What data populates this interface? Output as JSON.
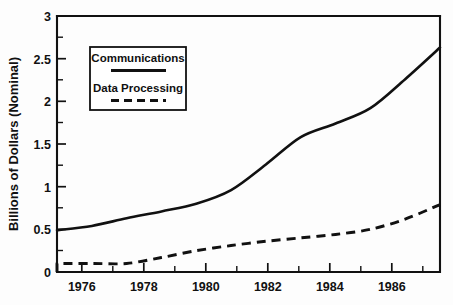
{
  "chart_data": {
    "type": "line",
    "title": "",
    "xlabel": "",
    "ylabel": "Billions of Dollars (Nominal)",
    "xlim": [
      1976,
      1987
    ],
    "ylim": [
      0,
      3
    ],
    "grid": false,
    "legend_position": "upper-left-inside",
    "x_tick_labels": [
      "1976",
      "1978",
      "1980",
      "1982",
      "1984",
      "1986"
    ],
    "x_tick_values": [
      1976,
      1978,
      1980,
      1982,
      1984,
      1986
    ],
    "x_minor_ticks": [
      1977,
      1979,
      1981,
      1983,
      1985,
      1987
    ],
    "y_tick_labels": [
      "0",
      "0.5",
      "1",
      "1.5",
      "2",
      "2.5",
      "3"
    ],
    "y_tick_values": [
      0,
      0.5,
      1,
      1.5,
      2,
      2.5,
      3
    ],
    "y_minor_ticks": [
      0.25,
      0.75,
      1.25,
      1.75,
      2.25,
      2.75
    ],
    "x": [
      1976,
      1977,
      1978,
      1979,
      1980,
      1981,
      1982,
      1983,
      1984,
      1985,
      1986,
      1987
    ],
    "series": [
      {
        "name": "Communications",
        "style": "solid",
        "color": "#111111",
        "values": [
          0.49,
          0.54,
          0.63,
          0.71,
          0.8,
          0.96,
          1.26,
          1.58,
          1.74,
          1.92,
          2.26,
          2.63
        ]
      },
      {
        "name": "Data Processing",
        "style": "dashed",
        "color": "#111111",
        "values": [
          0.1,
          0.1,
          0.1,
          0.17,
          0.25,
          0.31,
          0.36,
          0.4,
          0.44,
          0.5,
          0.62,
          0.79
        ]
      }
    ]
  },
  "legend": {
    "entries": [
      {
        "label": "Communications",
        "style": "solid"
      },
      {
        "label": "Data Processing",
        "style": "dashed"
      }
    ]
  },
  "axes": {
    "y_title": "Billions of Dollars (Nominal)"
  }
}
